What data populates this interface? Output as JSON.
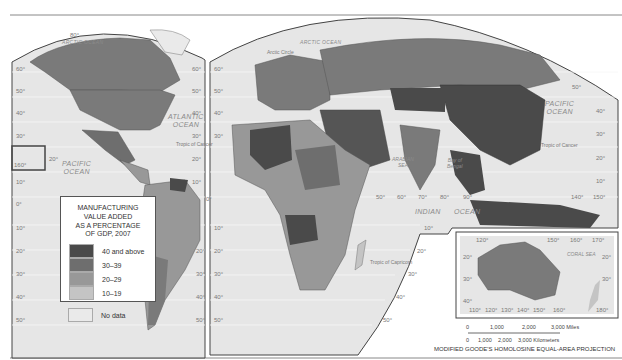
{
  "map": {
    "projection": "MODIFIED GOODE'S HOMOLOSINE EQUAL-AREA PROJECTION",
    "legend": {
      "title_lines": [
        "MANUFACTURING",
        "VALUE ADDED",
        "AS A PERCENTAGE",
        "OF GDP, 2007"
      ],
      "classes": [
        {
          "label": "40 and above",
          "color": "#4a4a4a"
        },
        {
          "label": "30–39",
          "color": "#6e6e6e"
        },
        {
          "label": "20–29",
          "color": "#989898"
        },
        {
          "label": "10–19",
          "color": "#c4c4c4"
        },
        {
          "label": "No data",
          "color": "#eaeaea"
        }
      ]
    },
    "colors": {
      "ocean": "#e6e6e6",
      "graticule": "#f7f7f7",
      "border": "#444444"
    },
    "oceans": {
      "arctic_left": "ARCTIC OCEAN",
      "arctic_right": "ARCTIC OCEAN",
      "atlantic": [
        "ATLANTIC",
        "OCEAN"
      ],
      "pacific_left": [
        "PACIFIC",
        "OCEAN"
      ],
      "pacific_right": [
        "PACIFIC",
        "OCEAN"
      ],
      "indian": [
        "INDIAN",
        "OCEAN"
      ],
      "arabian_sea": [
        "ARABIAN",
        "SEA"
      ],
      "bay_of_bengal": [
        "Bay of",
        "Bengal"
      ],
      "coral_sea": "CORAL SEA"
    },
    "lines": {
      "arctic_circle": "Arctic Circle",
      "tropic_cancer_left": "Tropic of Cancer",
      "tropic_cancer_right": "Tropic of Cancer",
      "tropic_capricorn": "Tropic of Capricorn"
    },
    "latitude_labels": {
      "left_edge": [
        "60°",
        "50°",
        "40°",
        "30°",
        "10°",
        "0°",
        "10°",
        "20°",
        "30°",
        "40°",
        "50°"
      ],
      "top": "80°",
      "hawaii": [
        "20°",
        "160°"
      ],
      "atlantic_edge": [
        "60°",
        "50°",
        "40°",
        "30°",
        "20°",
        "10°"
      ],
      "africa_edge": [
        "60°",
        "50°",
        "40°",
        "30°",
        "0°",
        "10°",
        "20°",
        "30°",
        "40°",
        "50°"
      ],
      "south_america_edge": [
        "20°",
        "30°",
        "40°",
        "50°"
      ],
      "indian_edge": [
        "10°",
        "20°",
        "30°",
        "40°",
        "50°"
      ],
      "pacific_edge": [
        "50°",
        "40°",
        "30°",
        "20°",
        "10°"
      ]
    },
    "longitude_labels": [
      "50°",
      "60°",
      "70°",
      "80°",
      "90°",
      "140°",
      "150°",
      "10°"
    ],
    "inset": {
      "top_labels": [
        "120°",
        "150°",
        "160°",
        "170°"
      ],
      "left_labels": [
        "20°",
        "30°",
        "40°"
      ],
      "right_labels": [
        "20°",
        "30°"
      ],
      "bottom_labels": [
        "110°",
        "120°",
        "130°",
        "140°",
        "150°",
        "160°",
        "180°"
      ]
    },
    "scale": {
      "miles": [
        "0",
        "1,000",
        "2,000",
        "3,000 Miles"
      ],
      "km": [
        "0",
        "1,000",
        "2,000",
        "3,000 Kilometers"
      ]
    }
  }
}
